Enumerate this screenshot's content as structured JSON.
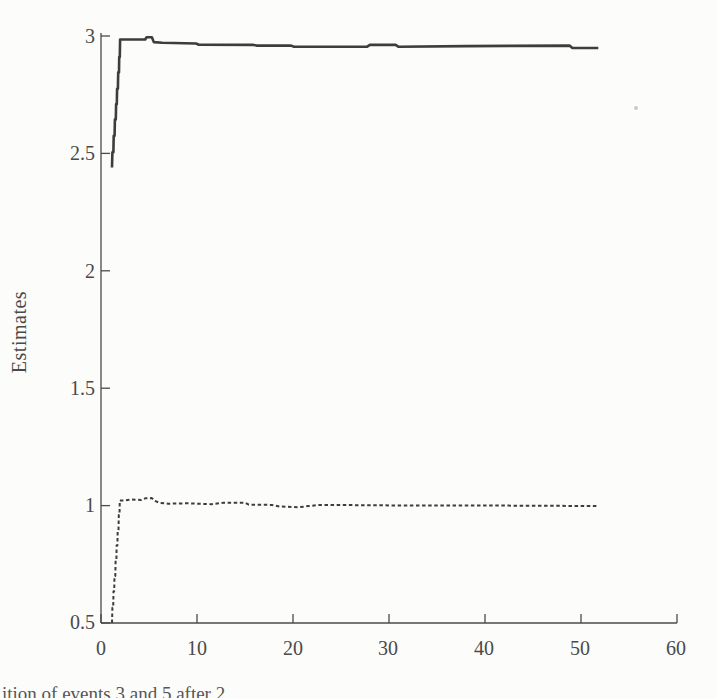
{
  "figure": {
    "ylabel": "Estimates",
    "caption_fragment": "ition of events 3 and 5 after 2",
    "background": "#fcfcfa",
    "axis_color": "#4b4b4b",
    "text_color": "#4a4a4a"
  },
  "chart_data": {
    "type": "line",
    "title": "",
    "xlabel": "",
    "ylabel": "Estimates",
    "xlim": [
      0,
      60
    ],
    "ylim": [
      0.5,
      3
    ],
    "grid": false,
    "legend": "none",
    "x_ticks": [
      0,
      10,
      20,
      30,
      40,
      50,
      60
    ],
    "y_ticks": [
      0.5,
      1,
      1.5,
      2,
      2.5,
      3
    ],
    "x_tick_labels": [
      "0",
      "10",
      "20",
      "30",
      "40",
      "50",
      "60"
    ],
    "y_tick_labels": [
      "0.5",
      "1",
      "1.5",
      "2",
      "2.5",
      "3"
    ],
    "series": [
      {
        "name": "estimate-converging-to-3",
        "style": "solid",
        "color": "#3d3d3d",
        "width": 2.6,
        "points": [
          [
            1.15,
            2.44
          ],
          [
            1.19,
            2.505
          ],
          [
            1.29,
            2.505
          ],
          [
            1.32,
            2.575
          ],
          [
            1.42,
            2.575
          ],
          [
            1.45,
            2.645
          ],
          [
            1.54,
            2.645
          ],
          [
            1.57,
            2.71
          ],
          [
            1.65,
            2.71
          ],
          [
            1.68,
            2.775
          ],
          [
            1.76,
            2.775
          ],
          [
            1.79,
            2.845
          ],
          [
            1.87,
            2.845
          ],
          [
            1.9,
            2.91
          ],
          [
            1.96,
            2.91
          ],
          [
            1.99,
            2.985
          ],
          [
            2.4,
            2.985
          ],
          [
            4.6,
            2.985
          ],
          [
            4.75,
            2.995
          ],
          [
            5.3,
            2.995
          ],
          [
            5.5,
            2.974
          ],
          [
            6.4,
            2.971
          ],
          [
            9.9,
            2.968
          ],
          [
            10.2,
            2.963
          ],
          [
            15.9,
            2.962
          ],
          [
            16.2,
            2.959
          ],
          [
            19.8,
            2.959
          ],
          [
            20.1,
            2.954
          ],
          [
            27.7,
            2.954
          ],
          [
            28.0,
            2.962
          ],
          [
            30.7,
            2.962
          ],
          [
            31.0,
            2.954
          ],
          [
            38.0,
            2.957
          ],
          [
            48.8,
            2.959
          ],
          [
            49.1,
            2.949
          ],
          [
            51.8,
            2.949
          ]
        ]
      },
      {
        "name": "estimate-converging-to-1",
        "style": "dashed",
        "color": "#3d3d3d",
        "width": 2.0,
        "dash": "3.5 2.6",
        "points": [
          [
            1.15,
            0.5
          ],
          [
            1.19,
            0.565
          ],
          [
            1.27,
            0.565
          ],
          [
            1.3,
            0.635
          ],
          [
            1.38,
            0.635
          ],
          [
            1.41,
            0.7
          ],
          [
            1.49,
            0.7
          ],
          [
            1.52,
            0.765
          ],
          [
            1.6,
            0.765
          ],
          [
            1.63,
            0.83
          ],
          [
            1.71,
            0.83
          ],
          [
            1.74,
            0.895
          ],
          [
            1.82,
            0.895
          ],
          [
            1.85,
            0.96
          ],
          [
            1.93,
            0.96
          ],
          [
            1.96,
            1.022
          ],
          [
            2.4,
            1.022
          ],
          [
            3.2,
            1.026
          ],
          [
            4.2,
            1.024
          ],
          [
            4.6,
            1.031
          ],
          [
            5.3,
            1.032
          ],
          [
            5.6,
            1.02
          ],
          [
            6.1,
            1.012
          ],
          [
            7.0,
            1.008
          ],
          [
            9.0,
            1.01
          ],
          [
            11.5,
            1.006
          ],
          [
            12.8,
            1.012
          ],
          [
            15.0,
            1.012
          ],
          [
            15.4,
            1.004
          ],
          [
            17.8,
            1.003
          ],
          [
            18.6,
            0.996
          ],
          [
            20.6,
            0.993
          ],
          [
            21.6,
            0.998
          ],
          [
            22.6,
            1.002
          ],
          [
            26.0,
            1.002
          ],
          [
            30.0,
            1.001
          ],
          [
            36.0,
            1.0
          ],
          [
            42.0,
            1.0
          ],
          [
            47.0,
            0.999
          ],
          [
            51.8,
            0.998
          ]
        ]
      }
    ]
  }
}
